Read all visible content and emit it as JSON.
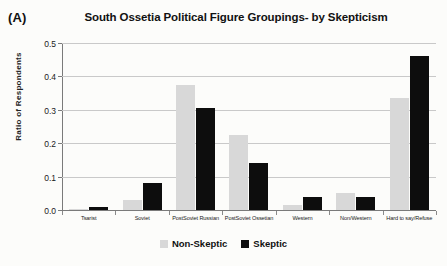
{
  "panel_label": "(A)",
  "chart_data": {
    "type": "bar",
    "title": "South Ossetia Political Figure Groupings- by Skepticism",
    "xlabel": "",
    "ylabel": "Ratio of Respondents",
    "ylim": [
      0,
      0.5
    ],
    "ytick_labels": [
      "0.0",
      "0.1",
      "0.2",
      "0.3",
      "0.4",
      "0.5"
    ],
    "ytick_values": [
      0,
      0.1,
      0.2,
      0.3,
      0.4,
      0.5
    ],
    "grid": true,
    "legend_position": "bottom-center",
    "categories": [
      "Tsarist",
      "Soviet",
      "PostSoviet Russian",
      "PostSoviet Ossetian",
      "Western",
      "Non/Western",
      "Hard to say/Refuse"
    ],
    "series": [
      {
        "name": "Non-Skeptic",
        "color": "#d8d8d8",
        "values": [
          0.003,
          0.03,
          0.375,
          0.225,
          0.015,
          0.05,
          0.335
        ]
      },
      {
        "name": "Skeptic",
        "color": "#0d0d0d",
        "values": [
          0.01,
          0.08,
          0.305,
          0.14,
          0.04,
          0.04,
          0.46
        ]
      }
    ]
  }
}
